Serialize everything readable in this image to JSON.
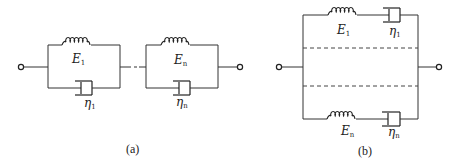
{
  "figure": {
    "panel_a": {
      "caption": "(a)",
      "description": "Series chain of Kelvin-Voigt elements (spring parallel with dashpot)",
      "elements": [
        {
          "spring_symbol": "E",
          "spring_sub": "1",
          "dashpot_symbol": "η",
          "dashpot_sub": "1"
        },
        {
          "spring_symbol": "E",
          "spring_sub": "n",
          "dashpot_symbol": "η",
          "dashpot_sub": "n"
        }
      ]
    },
    "panel_b": {
      "caption": "(b)",
      "description": "Parallel arrangement of Maxwell elements (spring in series with dashpot)",
      "elements": [
        {
          "spring_symbol": "E",
          "spring_sub": "1",
          "dashpot_symbol": "η",
          "dashpot_sub": "1"
        },
        {
          "spring_symbol": "E",
          "spring_sub": "n",
          "dashpot_symbol": "η",
          "dashpot_sub": "n"
        }
      ]
    },
    "colors": {
      "line": "#333333",
      "background": "#ffffff"
    }
  }
}
